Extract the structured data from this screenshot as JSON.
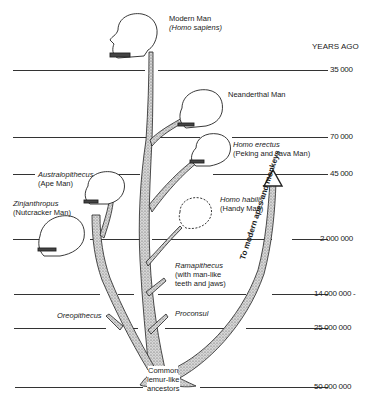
{
  "header": {
    "years_ago_label": "YEARS AGO"
  },
  "timeline": [
    {
      "label": "35 000",
      "y": 70
    },
    {
      "label": "70 000",
      "y": 137
    },
    {
      "label": "45 000",
      "y": 174
    },
    {
      "label": "2 000 000",
      "y": 239
    },
    {
      "label": "14 000 000 -",
      "y": 294
    },
    {
      "label": "25 000 000",
      "y": 328
    },
    {
      "label": "50 000 000",
      "y": 387
    }
  ],
  "species": {
    "modern_man": {
      "name": "Modern Man",
      "latin": "(Homo sapiens)"
    },
    "neanderthal": {
      "name": "Neanderthal Man"
    },
    "homo_erectus": {
      "name": "Homo erectus",
      "common": "(Peking and Java Man)"
    },
    "australopithecus": {
      "name": "Australopithecus",
      "common": "(Ape Man)"
    },
    "zinjanthropus": {
      "name": "Zinjanthropus",
      "common": "(Nutcracker Man)"
    },
    "homo_habilis": {
      "name": "Homo habilis",
      "common": "(Handy Man)"
    },
    "ramapithecus": {
      "name": "Ramapithecus",
      "line2": "(with man-like",
      "line3": "teeth and jaws)"
    },
    "oreopithecus": {
      "name": "Oreopithecus"
    },
    "proconsul": {
      "name": "Proconsul"
    },
    "common_ancestors": {
      "line1": "Common",
      "line2": "lemur-like",
      "line3": "ancestors"
    }
  },
  "arrow": {
    "label": "To modern apes and monkeys"
  }
}
